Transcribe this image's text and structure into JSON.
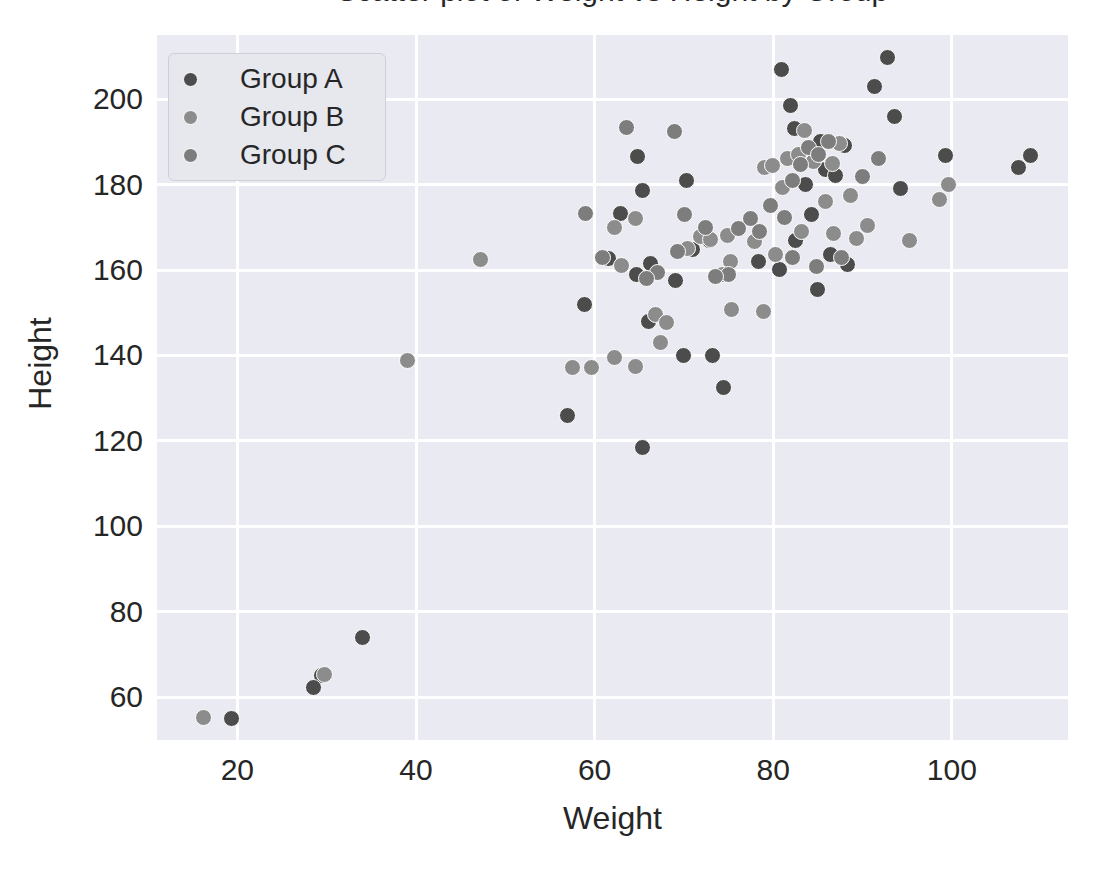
{
  "chart_data": {
    "type": "scatter",
    "title": "Scatter plot of Weight vs Height by Group",
    "xlabel": "Weight",
    "ylabel": "Height",
    "xlim": [
      11,
      113
    ],
    "ylim": [
      50,
      215
    ],
    "xticks": [
      20,
      40,
      60,
      80,
      100
    ],
    "yticks": [
      60,
      80,
      100,
      120,
      140,
      160,
      180,
      200
    ],
    "grid": true,
    "legend_position": "upper left",
    "background": "#eaeaf2",
    "gridline_color": "#ffffff",
    "series": [
      {
        "name": "Group A",
        "color": "#4c4c4c",
        "points": [
          [
            64.8,
            186.6
          ],
          [
            62.9,
            173.3
          ],
          [
            65.4,
            178.6
          ],
          [
            70.3,
            180.9
          ],
          [
            57.0,
            126.0
          ],
          [
            65.4,
            118.4
          ],
          [
            66.0,
            148.0
          ],
          [
            69.9,
            139.9
          ],
          [
            73.2,
            139.9
          ],
          [
            74.4,
            132.4
          ],
          [
            80.9,
            207.0
          ],
          [
            81.9,
            198.6
          ],
          [
            82.4,
            193.1
          ],
          [
            85.3,
            190.0
          ],
          [
            88.0,
            189.2
          ],
          [
            92.8,
            209.8
          ],
          [
            91.3,
            202.9
          ],
          [
            93.6,
            195.9
          ],
          [
            85.9,
            183.6
          ],
          [
            87.0,
            182.1
          ],
          [
            83.6,
            179.9
          ],
          [
            84.3,
            172.9
          ],
          [
            86.4,
            163.6
          ],
          [
            88.3,
            161.4
          ],
          [
            85.0,
            155.4
          ],
          [
            94.2,
            179.0
          ],
          [
            99.3,
            186.8
          ],
          [
            107.5,
            184.0
          ],
          [
            108.8,
            186.8
          ],
          [
            82.5,
            166.9
          ],
          [
            80.7,
            160.1
          ],
          [
            78.3,
            161.9
          ],
          [
            71.0,
            164.9
          ],
          [
            72.9,
            167.0
          ],
          [
            66.3,
            161.5
          ],
          [
            69.1,
            157.5
          ],
          [
            64.7,
            159.0
          ],
          [
            61.5,
            162.8
          ],
          [
            58.9,
            152.0
          ],
          [
            34.0,
            74.0
          ],
          [
            29.4,
            65.0
          ],
          [
            28.5,
            62.2
          ],
          [
            19.3,
            55.1
          ]
        ]
      },
      {
        "name": "Group B",
        "color": "#8c8c8c",
        "points": [
          [
            59.7,
            137.2
          ],
          [
            62.2,
            139.5
          ],
          [
            64.6,
            137.3
          ],
          [
            63.0,
            161.0
          ],
          [
            67.4,
            143.0
          ],
          [
            66.8,
            149.5
          ],
          [
            68.1,
            147.8
          ],
          [
            70.4,
            165.0
          ],
          [
            71.8,
            167.8
          ],
          [
            73.0,
            167.2
          ],
          [
            74.9,
            168.0
          ],
          [
            75.2,
            162.0
          ],
          [
            75.3,
            150.8
          ],
          [
            74.3,
            158.9
          ],
          [
            78.9,
            150.2
          ],
          [
            79.0,
            184.0
          ],
          [
            79.9,
            184.4
          ],
          [
            81.0,
            179.4
          ],
          [
            81.6,
            186.0
          ],
          [
            82.8,
            187.0
          ],
          [
            83.5,
            192.6
          ],
          [
            84.5,
            185.5
          ],
          [
            85.8,
            176.0
          ],
          [
            86.6,
            185.0
          ],
          [
            87.4,
            189.5
          ],
          [
            88.6,
            177.4
          ],
          [
            89.3,
            167.4
          ],
          [
            90.6,
            170.5
          ],
          [
            95.3,
            167.0
          ],
          [
            98.6,
            176.5
          ],
          [
            99.6,
            180.0
          ],
          [
            47.2,
            162.4
          ],
          [
            39.0,
            138.9
          ],
          [
            16.2,
            55.3
          ],
          [
            29.8,
            65.4
          ],
          [
            57.5,
            137.1
          ],
          [
            62.2,
            170.0
          ],
          [
            64.6,
            172.0
          ],
          [
            80.2,
            163.6
          ],
          [
            83.2,
            169.0
          ],
          [
            86.8,
            168.5
          ],
          [
            77.9,
            166.7
          ]
        ]
      },
      {
        "name": "Group C",
        "color": "#7d7d7d",
        "points": [
          [
            63.6,
            193.4
          ],
          [
            68.9,
            192.4
          ],
          [
            70.1,
            173.1
          ],
          [
            69.3,
            164.4
          ],
          [
            67.0,
            159.5
          ],
          [
            65.8,
            158.0
          ],
          [
            60.9,
            163.0
          ],
          [
            59.0,
            173.3
          ],
          [
            72.4,
            170.0
          ],
          [
            76.1,
            169.6
          ],
          [
            77.5,
            172.0
          ],
          [
            82.1,
            181.0
          ],
          [
            83.0,
            184.6
          ],
          [
            84.0,
            188.6
          ],
          [
            85.1,
            187.0
          ],
          [
            86.2,
            190.0
          ],
          [
            79.7,
            175.0
          ],
          [
            78.5,
            168.9
          ],
          [
            81.3,
            172.4
          ],
          [
            82.2,
            163.0
          ],
          [
            84.8,
            160.8
          ],
          [
            87.6,
            163.0
          ],
          [
            90.0,
            182.0
          ],
          [
            91.8,
            186.0
          ],
          [
            75.0,
            159.0
          ],
          [
            73.5,
            158.4
          ]
        ]
      }
    ]
  },
  "legend": {
    "items": [
      {
        "label": "Group A",
        "color": "#4c4c4c"
      },
      {
        "label": "Group B",
        "color": "#8c8c8c"
      },
      {
        "label": "Group C",
        "color": "#7d7d7d"
      }
    ]
  },
  "axes": {
    "x": {
      "label": "Weight",
      "ticks": [
        "20",
        "40",
        "60",
        "80",
        "100"
      ]
    },
    "y": {
      "label": "Height",
      "ticks": [
        "60",
        "80",
        "100",
        "120",
        "140",
        "160",
        "180",
        "200"
      ]
    }
  }
}
